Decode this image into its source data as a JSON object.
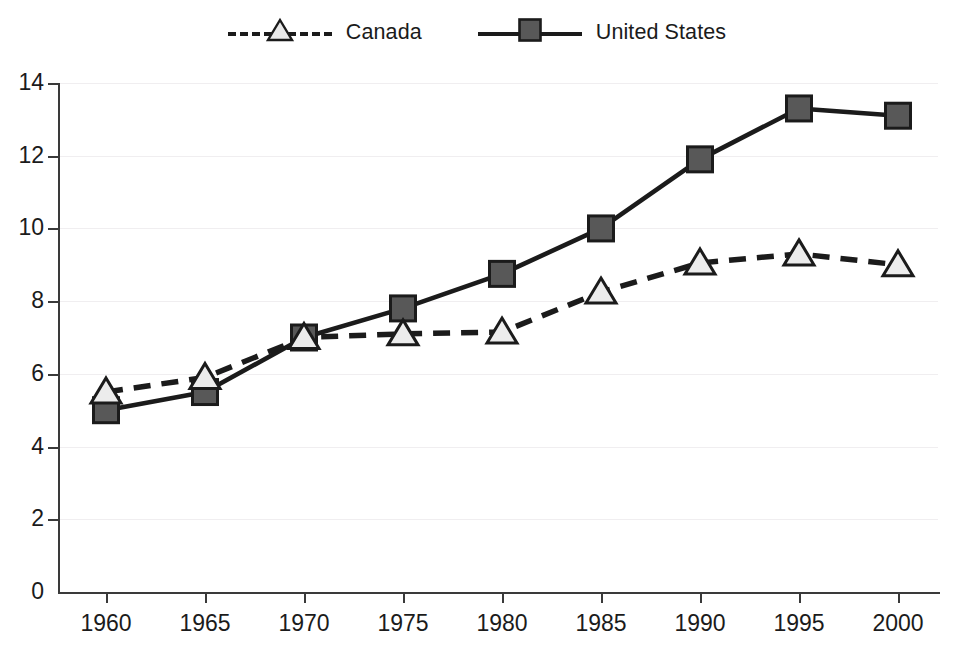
{
  "legend": {
    "position": "top-center",
    "entries": [
      {
        "label": "Canada",
        "marker": "triangle-open",
        "line": "dashed",
        "color": "#1b1b1b",
        "marker_fill": "#e8e8e8",
        "icon": "legend-dashed-triangle-icon"
      },
      {
        "label": "United States",
        "marker": "square-filled",
        "line": "solid",
        "color": "#1b1b1b",
        "marker_fill": "#555555",
        "icon": "legend-solid-square-icon"
      }
    ]
  },
  "axes": {
    "y_ticks": [
      "0",
      "2",
      "4",
      "6",
      "8",
      "10",
      "12",
      "14"
    ],
    "x_ticks": [
      "1960",
      "1965",
      "1970",
      "1975",
      "1980",
      "1985",
      "1990",
      "1995",
      "2000"
    ],
    "y_label": "",
    "x_label": "",
    "grid": "horizontal"
  },
  "chart_data": {
    "type": "line",
    "title": "",
    "subtitle": "",
    "xlabel": "",
    "ylabel": "",
    "xlim": [
      1960,
      2000
    ],
    "ylim": [
      0,
      14
    ],
    "grid": true,
    "legend_position": "top-center",
    "x": [
      1960,
      1965,
      1970,
      1975,
      1980,
      1985,
      1990,
      1995,
      2000
    ],
    "categories": [
      "1960",
      "1965",
      "1970",
      "1975",
      "1980",
      "1985",
      "1990",
      "1995",
      "2000"
    ],
    "series": [
      {
        "name": "Canada",
        "style": "dashed",
        "marker": "triangle-open",
        "values": [
          5.5,
          5.9,
          7.0,
          7.1,
          7.15,
          8.25,
          9.05,
          9.3,
          9.0
        ]
      },
      {
        "name": "United States",
        "style": "solid",
        "marker": "square-filled",
        "values": [
          5.0,
          5.5,
          7.0,
          7.8,
          8.75,
          10.0,
          11.9,
          13.3,
          13.1
        ]
      }
    ]
  }
}
